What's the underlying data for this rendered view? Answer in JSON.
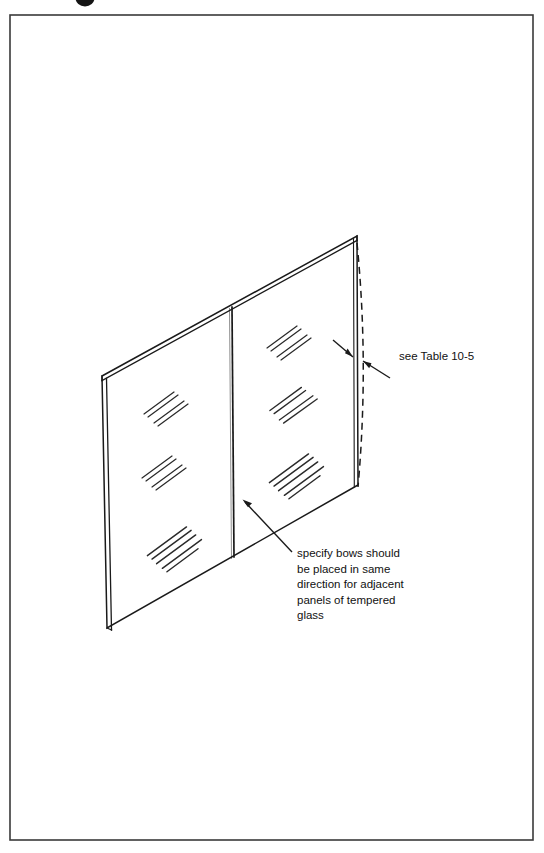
{
  "figure": {
    "domain": "technical-line-drawing",
    "title_fragment_visible": "partial-glyph-clipped-at-top-edge",
    "background_color": "#ffffff",
    "ink_color": "#1a1a1a",
    "border": {
      "name": "page-border-frame",
      "x": 10,
      "y": 15,
      "width": 523,
      "height": 825,
      "stroke": "#3a3a3a",
      "stroke_width": 1.6
    },
    "glass_assembly": {
      "name": "tempered-glass-panel-assembly",
      "top_left": [
        102,
        376
      ],
      "top_right": [
        357,
        236
      ],
      "bottom_right": [
        358,
        485
      ],
      "bottom_left": [
        107,
        628
      ],
      "thickness_offset": 4,
      "divider_top": [
        232,
        307
      ],
      "divider_bottom": [
        234,
        557
      ],
      "panels": [
        {
          "name": "left-glass-panel",
          "label": "left panel"
        },
        {
          "name": "right-glass-panel",
          "label": "right panel"
        }
      ]
    },
    "bow_reference_line": {
      "name": "bow-dashed-reference-line",
      "style": "dashed",
      "dash_pattern": "7 5",
      "start": [
        357,
        243
      ],
      "control": [
        369,
        364
      ],
      "end": [
        358,
        487
      ],
      "description": "dashed curve bowing outward from the straight right edge"
    },
    "annotations": [
      {
        "id": "see-table",
        "name": "see-table-annotation",
        "text": "see Table 10-5",
        "text_x": 399,
        "text_y": 360,
        "target": [
          358,
          359
        ],
        "leaders": [
          {
            "name": "table-leader-upper",
            "from": [
              335,
              341
            ],
            "to": [
              354,
              357
            ]
          },
          {
            "name": "table-leader-lower",
            "from": [
              389,
              377
            ],
            "to": [
              362,
              362
            ]
          }
        ]
      },
      {
        "id": "bow-direction",
        "name": "bow-direction-annotation",
        "lines": [
          "specify bows should",
          "be placed in same",
          "direction for adjacent",
          "panels of tempered",
          "glass"
        ],
        "text_x": 297,
        "text_y": 557,
        "line_height": 15.5,
        "leader": {
          "name": "bow-direction-leader",
          "from": [
            292,
            552
          ],
          "to": [
            243,
            500
          ]
        }
      }
    ],
    "sparkle_marks": {
      "name": "glass-sparkle-hatch-marks",
      "description": "paired short parallel diagonal strokes indicating glazed glass surface",
      "clusters": [
        {
          "name": "sparkle-left-upper",
          "x": 166,
          "y": 404,
          "scale": 1.0
        },
        {
          "name": "sparkle-left-middle",
          "x": 164,
          "y": 468,
          "scale": 1.0
        },
        {
          "name": "sparkle-left-lower",
          "x": 175,
          "y": 543,
          "scale": 1.15
        },
        {
          "name": "sparkle-right-upper",
          "x": 289,
          "y": 338,
          "scale": 1.0
        },
        {
          "name": "sparkle-right-middle",
          "x": 293,
          "y": 400,
          "scale": 1.05
        },
        {
          "name": "sparkle-right-lower",
          "x": 297,
          "y": 470,
          "scale": 1.15
        }
      ]
    }
  }
}
